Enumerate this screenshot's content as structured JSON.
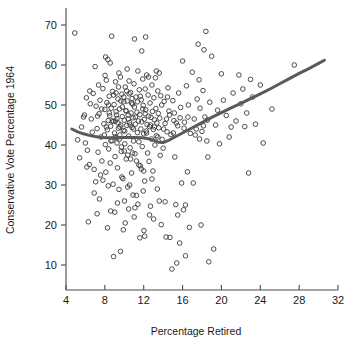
{
  "chart_data": {
    "type": "scatter",
    "title": "",
    "xlabel": "Percentage Retired",
    "ylabel": "Conservative Vote Percentage 1964",
    "xlim": [
      4,
      32
    ],
    "ylim": [
      7,
      71
    ],
    "xticks": [
      4,
      8,
      12,
      16,
      20,
      24,
      28,
      32
    ],
    "yticks": [
      10,
      20,
      30,
      40,
      50,
      60,
      70
    ],
    "xtick_labels": [
      "4",
      "8",
      "12",
      "16",
      "20",
      "24",
      "28",
      "32"
    ],
    "ytick_labels": [
      "10",
      "20",
      "30",
      "40",
      "50",
      "60",
      "70"
    ],
    "grid": false,
    "legend": "none",
    "marker": {
      "style": "open-circle",
      "radius": 2.3,
      "color": "#3a3a3a",
      "stroke_width": 0.9
    },
    "smoother": {
      "name": "lowess-smooth",
      "color": "#5a5a5a",
      "width": 3.0,
      "points": [
        [
          4.6,
          44.0
        ],
        [
          5.2,
          43.3
        ],
        [
          5.8,
          42.8
        ],
        [
          6.4,
          42.4
        ],
        [
          7.0,
          42.1
        ],
        [
          7.6,
          41.9
        ],
        [
          8.2,
          41.8
        ],
        [
          8.8,
          41.8
        ],
        [
          9.4,
          41.8
        ],
        [
          10.0,
          41.9
        ],
        [
          10.6,
          41.9
        ],
        [
          11.2,
          41.9
        ],
        [
          11.8,
          41.8
        ],
        [
          12.4,
          41.6
        ],
        [
          13.0,
          41.2
        ],
        [
          13.5,
          40.7
        ],
        [
          14.0,
          40.6
        ],
        [
          14.6,
          41.2
        ],
        [
          15.2,
          42.0
        ],
        [
          16.0,
          43.0
        ],
        [
          17.0,
          44.3
        ],
        [
          18.0,
          45.6
        ],
        [
          19.0,
          46.9
        ],
        [
          20.0,
          48.1
        ],
        [
          21.0,
          49.3
        ],
        [
          22.0,
          50.4
        ],
        [
          23.0,
          51.6
        ],
        [
          24.0,
          52.8
        ],
        [
          25.0,
          54.0
        ],
        [
          26.0,
          55.3
        ],
        [
          27.0,
          56.6
        ],
        [
          28.0,
          57.9
        ],
        [
          29.0,
          59.1
        ],
        [
          30.0,
          60.4
        ],
        [
          30.6,
          61.2
        ]
      ]
    },
    "points": [
      [
        4.9,
        68.0
      ],
      [
        5.2,
        41.3
      ],
      [
        5.4,
        36.8
      ],
      [
        5.8,
        47.0
      ],
      [
        6.0,
        40.5
      ],
      [
        6.2,
        38.7
      ],
      [
        6.4,
        35.1
      ],
      [
        6.5,
        50.3
      ],
      [
        6.6,
        46.5
      ],
      [
        6.7,
        43.2
      ],
      [
        6.8,
        52.9
      ],
      [
        6.9,
        33.9
      ],
      [
        7.0,
        59.6
      ],
      [
        7.1,
        49.7
      ],
      [
        7.2,
        44.1
      ],
      [
        7.3,
        38.2
      ],
      [
        7.4,
        47.8
      ],
      [
        7.5,
        51.2
      ],
      [
        7.6,
        42.0
      ],
      [
        7.7,
        36.0
      ],
      [
        7.8,
        54.1
      ],
      [
        7.9,
        45.3
      ],
      [
        8.0,
        48.9
      ],
      [
        8.05,
        40.1
      ],
      [
        8.1,
        33.2
      ],
      [
        8.15,
        56.2
      ],
      [
        8.2,
        50.6
      ],
      [
        8.25,
        43.8
      ],
      [
        8.3,
        61.4
      ],
      [
        8.35,
        46.1
      ],
      [
        8.4,
        39.0
      ],
      [
        8.45,
        52.2
      ],
      [
        8.5,
        47.3
      ],
      [
        8.55,
        35.5
      ],
      [
        8.6,
        44.7
      ],
      [
        8.65,
        49.2
      ],
      [
        8.7,
        67.2
      ],
      [
        8.75,
        41.1
      ],
      [
        8.8,
        53.4
      ],
      [
        8.85,
        30.2
      ],
      [
        8.9,
        45.9
      ],
      [
        8.95,
        50.1
      ],
      [
        9.0,
        43.0
      ],
      [
        9.05,
        37.1
      ],
      [
        9.1,
        55.8
      ],
      [
        9.15,
        48.3
      ],
      [
        9.2,
        41.8
      ],
      [
        9.25,
        46.6
      ],
      [
        9.3,
        34.3
      ],
      [
        9.35,
        51.5
      ],
      [
        9.4,
        44.2
      ],
      [
        9.45,
        28.9
      ],
      [
        9.5,
        49.0
      ],
      [
        9.55,
        42.5
      ],
      [
        9.6,
        57.0
      ],
      [
        9.65,
        45.0
      ],
      [
        9.7,
        38.4
      ],
      [
        9.75,
        52.7
      ],
      [
        9.8,
        47.1
      ],
      [
        9.85,
        31.6
      ],
      [
        9.9,
        43.6
      ],
      [
        9.95,
        50.8
      ],
      [
        10.0,
        46.2
      ],
      [
        10.05,
        40.3
      ],
      [
        10.1,
        54.5
      ],
      [
        10.15,
        48.6
      ],
      [
        10.2,
        36.5
      ],
      [
        10.25,
        44.9
      ],
      [
        10.3,
        51.0
      ],
      [
        10.35,
        29.5
      ],
      [
        10.4,
        47.5
      ],
      [
        10.45,
        42.2
      ],
      [
        10.5,
        56.0
      ],
      [
        10.55,
        45.6
      ],
      [
        10.6,
        39.3
      ],
      [
        10.65,
        53.1
      ],
      [
        10.7,
        48.0
      ],
      [
        10.75,
        33.0
      ],
      [
        10.8,
        44.4
      ],
      [
        10.85,
        50.2
      ],
      [
        10.9,
        46.8
      ],
      [
        10.95,
        41.0
      ],
      [
        11.0,
        55.3
      ],
      [
        11.05,
        49.5
      ],
      [
        11.1,
        37.8
      ],
      [
        11.15,
        45.2
      ],
      [
        11.2,
        52.0
      ],
      [
        11.25,
        27.4
      ],
      [
        11.3,
        48.2
      ],
      [
        11.35,
        43.1
      ],
      [
        11.4,
        58.5
      ],
      [
        11.45,
        46.0
      ],
      [
        11.5,
        40.8
      ],
      [
        11.55,
        53.8
      ],
      [
        11.6,
        47.6
      ],
      [
        11.65,
        34.8
      ],
      [
        11.7,
        44.0
      ],
      [
        11.75,
        51.3
      ],
      [
        11.8,
        45.8
      ],
      [
        11.85,
        39.6
      ],
      [
        11.9,
        56.5
      ],
      [
        11.95,
        49.9
      ],
      [
        12.0,
        42.8
      ],
      [
        12.05,
        46.4
      ],
      [
        12.1,
        31.0
      ],
      [
        12.15,
        54.0
      ],
      [
        12.2,
        48.8
      ],
      [
        12.25,
        43.5
      ],
      [
        12.3,
        57.5
      ],
      [
        12.35,
        45.1
      ],
      [
        12.4,
        38.0
      ],
      [
        12.45,
        52.5
      ],
      [
        12.5,
        47.2
      ],
      [
        12.55,
        35.9
      ],
      [
        12.6,
        44.6
      ],
      [
        12.65,
        50.5
      ],
      [
        12.7,
        24.7
      ],
      [
        12.75,
        46.9
      ],
      [
        12.8,
        41.5
      ],
      [
        12.85,
        55.0
      ],
      [
        12.9,
        48.4
      ],
      [
        12.95,
        33.5
      ],
      [
        13.0,
        43.9
      ],
      [
        13.05,
        51.8
      ],
      [
        13.1,
        46.3
      ],
      [
        13.15,
        40.0
      ],
      [
        13.2,
        56.8
      ],
      [
        13.25,
        49.1
      ],
      [
        13.3,
        42.3
      ],
      [
        13.35,
        45.5
      ],
      [
        13.4,
        29.0
      ],
      [
        13.45,
        53.5
      ],
      [
        13.5,
        47.9
      ],
      [
        13.55,
        44.3
      ],
      [
        13.6,
        58.0
      ],
      [
        13.65,
        46.7
      ],
      [
        13.7,
        37.4
      ],
      [
        13.75,
        52.3
      ],
      [
        13.8,
        20.1
      ],
      [
        13.9,
        41.4
      ],
      [
        14.0,
        39.2
      ],
      [
        14.1,
        50.9
      ],
      [
        14.2,
        45.4
      ],
      [
        14.3,
        17.0
      ],
      [
        14.4,
        43.3
      ],
      [
        14.5,
        54.3
      ],
      [
        14.6,
        48.5
      ],
      [
        14.7,
        16.9
      ],
      [
        14.8,
        42.6
      ],
      [
        14.9,
        9.0
      ],
      [
        15.0,
        51.1
      ],
      [
        15.1,
        46.1
      ],
      [
        15.2,
        37.0
      ],
      [
        15.3,
        25.1
      ],
      [
        15.4,
        10.5
      ],
      [
        15.5,
        44.8
      ],
      [
        15.6,
        53.0
      ],
      [
        15.7,
        15.5
      ],
      [
        15.8,
        49.4
      ],
      [
        15.9,
        30.5
      ],
      [
        16.0,
        61.0
      ],
      [
        16.1,
        23.8
      ],
      [
        16.2,
        45.7
      ],
      [
        16.3,
        12.3
      ],
      [
        16.4,
        54.8
      ],
      [
        16.5,
        33.3
      ],
      [
        16.6,
        50.0
      ],
      [
        16.7,
        19.4
      ],
      [
        16.8,
        42.9
      ],
      [
        17.0,
        58.2
      ],
      [
        17.2,
        46.5
      ],
      [
        17.4,
        44.0
      ],
      [
        17.5,
        51.5
      ],
      [
        17.6,
        65.2
      ],
      [
        17.7,
        56.3
      ],
      [
        17.8,
        49.2
      ],
      [
        17.9,
        20.0
      ],
      [
        18.0,
        43.4
      ],
      [
        18.1,
        53.6
      ],
      [
        18.2,
        63.8
      ],
      [
        18.3,
        47.0
      ],
      [
        18.4,
        68.4
      ],
      [
        18.5,
        41.0
      ],
      [
        18.6,
        37.0
      ],
      [
        18.7,
        10.8
      ],
      [
        18.8,
        50.7
      ],
      [
        19.0,
        62.2
      ],
      [
        19.2,
        14.0
      ],
      [
        19.4,
        45.0
      ],
      [
        19.6,
        48.7
      ],
      [
        19.8,
        40.3
      ],
      [
        20.0,
        57.8
      ],
      [
        20.2,
        51.2
      ],
      [
        20.5,
        47.4
      ],
      [
        20.8,
        42.0
      ],
      [
        21.0,
        44.5
      ],
      [
        21.2,
        53.0
      ],
      [
        21.5,
        46.0
      ],
      [
        21.8,
        57.5
      ],
      [
        22.0,
        50.3
      ],
      [
        22.2,
        54.0
      ],
      [
        22.4,
        44.6
      ],
      [
        22.6,
        48.0
      ],
      [
        22.8,
        33.0
      ],
      [
        23.0,
        56.4
      ],
      [
        23.2,
        52.0
      ],
      [
        23.5,
        45.2
      ],
      [
        24.0,
        55.0
      ],
      [
        24.3,
        40.5
      ],
      [
        25.2,
        49.0
      ],
      [
        27.5,
        60.0
      ],
      [
        5.6,
        44.5
      ],
      [
        6.1,
        51.8
      ],
      [
        7.05,
        30.8
      ],
      [
        8.02,
        57.4
      ],
      [
        9.02,
        23.2
      ],
      [
        10.02,
        26.0
      ],
      [
        11.02,
        22.0
      ],
      [
        12.02,
        18.6
      ],
      [
        13.02,
        21.5
      ],
      [
        7.45,
        26.5
      ],
      [
        8.28,
        19.3
      ],
      [
        8.9,
        12.1
      ],
      [
        9.6,
        13.4
      ],
      [
        10.1,
        20.5
      ],
      [
        11.1,
        24.3
      ],
      [
        12.1,
        17.2
      ],
      [
        6.3,
        20.8
      ],
      [
        7.2,
        22.8
      ],
      [
        8.6,
        23.5
      ],
      [
        9.9,
        18.8
      ],
      [
        10.9,
        27.5
      ],
      [
        11.6,
        16.8
      ],
      [
        6.9,
        28.0
      ],
      [
        7.8,
        31.2
      ],
      [
        9.3,
        25.5
      ],
      [
        10.45,
        24.0
      ],
      [
        11.4,
        25.2
      ],
      [
        12.6,
        22.5
      ],
      [
        5.9,
        47.5
      ],
      [
        6.45,
        53.5
      ],
      [
        7.35,
        55.0
      ],
      [
        8.08,
        62.0
      ],
      [
        8.55,
        60.5
      ],
      [
        9.45,
        58.0
      ],
      [
        10.3,
        59.0
      ],
      [
        11.05,
        66.5
      ],
      [
        11.8,
        63.5
      ],
      [
        12.2,
        67.0
      ],
      [
        12.5,
        57.0
      ],
      [
        13.3,
        58.5
      ],
      [
        6.15,
        34.5
      ],
      [
        7.55,
        32.5
      ],
      [
        8.35,
        29.8
      ],
      [
        9.75,
        32.0
      ],
      [
        10.55,
        30.0
      ],
      [
        11.95,
        28.5
      ],
      [
        12.85,
        31.5
      ],
      [
        13.6,
        26.0
      ],
      [
        14.2,
        25.8
      ],
      [
        15.5,
        22.5
      ],
      [
        16.3,
        25.0
      ],
      [
        17.1,
        30.5
      ],
      [
        9.1,
        46.0
      ],
      [
        9.2,
        47.5
      ],
      [
        9.35,
        45.5
      ],
      [
        9.55,
        44.5
      ],
      [
        9.8,
        49.5
      ],
      [
        10.05,
        43.5
      ],
      [
        10.2,
        48.5
      ],
      [
        10.4,
        46.5
      ],
      [
        10.6,
        45.0
      ],
      [
        10.75,
        50.5
      ],
      [
        10.95,
        44.0
      ],
      [
        11.15,
        47.0
      ],
      [
        9.05,
        42.0
      ],
      [
        9.25,
        40.5
      ],
      [
        9.5,
        41.5
      ],
      [
        9.7,
        39.5
      ],
      [
        10.0,
        38.5
      ],
      [
        10.35,
        37.5
      ],
      [
        10.65,
        36.5
      ],
      [
        10.85,
        38.0
      ],
      [
        11.25,
        36.0
      ],
      [
        11.5,
        35.0
      ],
      [
        11.75,
        34.0
      ],
      [
        12.0,
        33.5
      ],
      [
        8.9,
        52.5
      ],
      [
        9.15,
        53.0
      ],
      [
        9.4,
        54.5
      ],
      [
        9.65,
        51.0
      ],
      [
        9.95,
        52.0
      ],
      [
        10.25,
        53.5
      ],
      [
        10.5,
        52.8
      ],
      [
        10.8,
        51.6
      ],
      [
        11.35,
        50.8
      ],
      [
        11.65,
        52.2
      ],
      [
        11.9,
        49.0
      ],
      [
        12.15,
        47.8
      ],
      [
        8.45,
        48.0
      ],
      [
        8.75,
        46.0
      ],
      [
        8.15,
        44.5
      ],
      [
        7.95,
        42.5
      ],
      [
        8.62,
        41.0
      ],
      [
        8.38,
        50.0
      ],
      [
        7.68,
        49.0
      ],
      [
        7.25,
        47.2
      ],
      [
        12.3,
        43.0
      ],
      [
        12.7,
        45.0
      ],
      [
        13.1,
        44.5
      ],
      [
        13.45,
        42.0
      ],
      [
        14.05,
        44.0
      ],
      [
        14.35,
        46.5
      ],
      [
        14.65,
        47.5
      ],
      [
        15.05,
        43.0
      ],
      [
        15.35,
        45.5
      ],
      [
        13.85,
        50.0
      ],
      [
        14.45,
        52.0
      ],
      [
        15.15,
        48.0
      ],
      [
        15.75,
        46.8
      ],
      [
        16.15,
        44.2
      ],
      [
        16.55,
        47.0
      ],
      [
        17.3,
        42.5
      ],
      [
        17.75,
        41.5
      ],
      [
        18.15,
        44.8
      ],
      [
        18.55,
        46.2
      ]
    ]
  }
}
